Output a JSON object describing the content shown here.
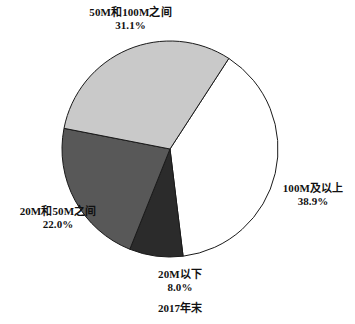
{
  "chart_data": {
    "type": "pie",
    "title": "",
    "caption": "2017年末",
    "legend_position": "none",
    "unit": "%",
    "center": {
      "x": 170,
      "y": 149
    },
    "radius": 108,
    "start_angle_deg": -57.0,
    "direction": "clockwise",
    "categories": [
      "100M及以上",
      "20M以下",
      "20M和50M之间",
      "50M和100M之间"
    ],
    "values": [
      38.9,
      8.0,
      22.0,
      31.1
    ],
    "slices": [
      {
        "label": "100M及以上",
        "value": 38.9,
        "value_text": "38.9%",
        "color": "#ffffff",
        "stroke": "#1a1a1a"
      },
      {
        "label": "20M以下",
        "value": 8.0,
        "value_text": "8.0%",
        "color": "#2b2b2b",
        "stroke": "#1a1a1a"
      },
      {
        "label": "20M和50M之间",
        "value": 22.0,
        "value_text": "22.0%",
        "color": "#585858",
        "stroke": "#1a1a1a"
      },
      {
        "label": "50M和100M之间",
        "value": 31.1,
        "value_text": "31.1%",
        "color": "#c9c9c9",
        "stroke": "#1a1a1a"
      }
    ]
  },
  "labels": {
    "top": {
      "name": "50M和100M之间",
      "value": "31.1%"
    },
    "right": {
      "name": "100M及以上",
      "value": "38.9%"
    },
    "left": {
      "name": "20M和50M之间",
      "value": "22.0%"
    },
    "bottom": {
      "name": "20M以下",
      "value": "8.0%"
    }
  },
  "caption": "2017年末"
}
